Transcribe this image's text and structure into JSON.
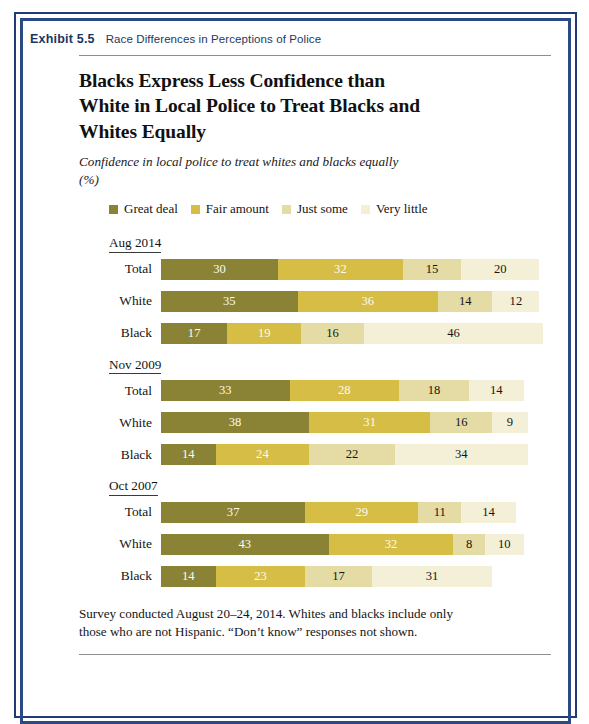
{
  "exhibit": {
    "number_label": "Exhibit 5.5",
    "caption": "Race Differences in Perceptions of Police"
  },
  "headline": "Blacks Express Less Confidence than White in Local Police to Treat Blacks and Whites Equally",
  "subtitle": "Confidence in local police to treat whites and blacks equally (%)",
  "footnote": "Survey conducted August 20–24, 2014. Whites and blacks include only those who are not Hispanic. “Don’t know” responses not shown.",
  "colors": {
    "great_deal": "#8a8235",
    "fair_amount": "#d6bd45",
    "just_some": "#e4dca4",
    "very_little": "#f4f0d8",
    "border_blue": "#1f3d73",
    "border_blue_inner": "#2a4a84",
    "exhibit_label": "#1c3663",
    "rule": "#8e8e8e"
  },
  "chart_data": {
    "type": "bar",
    "orientation": "horizontal",
    "stacked": true,
    "title": "Blacks Express Less Confidence than White in Local Police to Treat Blacks and Whites Equally",
    "subtitle": "Confidence in local police to treat whites and blacks equally (%)",
    "xlabel": "",
    "ylabel": "",
    "xlim": [
      0,
      100
    ],
    "grid": false,
    "legend_position": "top",
    "legend": [
      {
        "label": "Great deal",
        "color": "#8a8235"
      },
      {
        "label": "Fair amount",
        "color": "#d6bd45"
      },
      {
        "label": "Just some",
        "color": "#e4dca4"
      },
      {
        "label": "Very little",
        "color": "#f4f0d8"
      }
    ],
    "series_names": [
      "Great deal",
      "Fair amount",
      "Just some",
      "Very little"
    ],
    "groups": [
      {
        "label": "Aug 2014",
        "rows": [
          {
            "label": "Total",
            "values": [
              30,
              32,
              15,
              20
            ]
          },
          {
            "label": "White",
            "values": [
              35,
              36,
              14,
              12
            ]
          },
          {
            "label": "Black",
            "values": [
              17,
              19,
              16,
              46
            ]
          }
        ]
      },
      {
        "label": "Nov 2009",
        "rows": [
          {
            "label": "Total",
            "values": [
              33,
              28,
              18,
              14
            ]
          },
          {
            "label": "White",
            "values": [
              38,
              31,
              16,
              9
            ]
          },
          {
            "label": "Black",
            "values": [
              14,
              24,
              22,
              34
            ]
          }
        ]
      },
      {
        "label": "Oct 2007",
        "rows": [
          {
            "label": "Total",
            "values": [
              37,
              29,
              11,
              14
            ]
          },
          {
            "label": "White",
            "values": [
              43,
              32,
              8,
              10
            ]
          },
          {
            "label": "Black",
            "values": [
              14,
              23,
              17,
              31
            ]
          }
        ]
      }
    ]
  }
}
